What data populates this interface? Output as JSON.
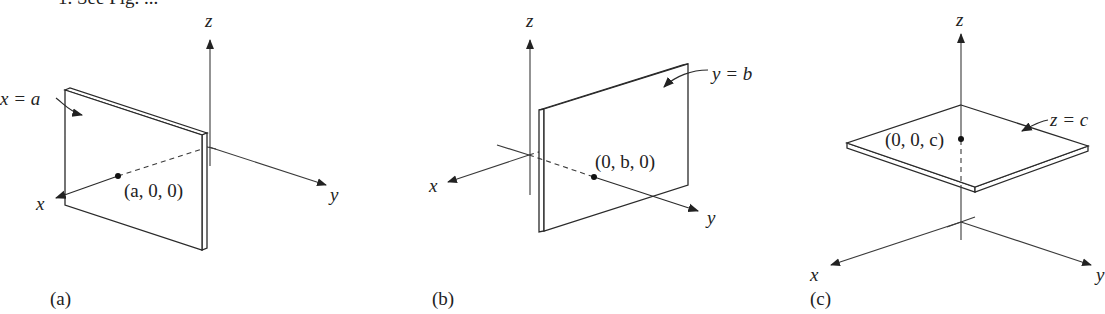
{
  "header": {
    "partial_text": "1. See Fig. ..."
  },
  "panels": [
    {
      "id": "a",
      "caption": "(a)",
      "plane_label": "x = a",
      "point_label": "(a, 0, 0)",
      "axes": {
        "x": "x",
        "y": "y",
        "z": "z"
      }
    },
    {
      "id": "b",
      "caption": "(b)",
      "plane_label": "y = b",
      "point_label": "(0, b, 0)",
      "axes": {
        "x": "x",
        "y": "y",
        "z": "z"
      }
    },
    {
      "id": "c",
      "caption": "(c)",
      "plane_label": "z = c",
      "point_label": "(0, 0, c)",
      "axes": {
        "x": "x",
        "y": "y",
        "z": "z"
      }
    }
  ],
  "colors": {
    "ink": "#2a2a2a",
    "background": "#ffffff"
  }
}
